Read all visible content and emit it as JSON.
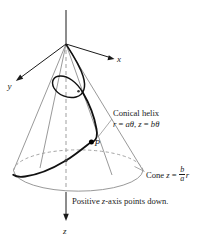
{
  "figure": {
    "background_color": "#ffffff",
    "ink_color": "#1a1a1a",
    "cone_color": "#8d8d8d",
    "curve_color": "#111111"
  },
  "axes": {
    "x_label": "x",
    "y_label": "y",
    "z_label": "z",
    "origin_note": "apex at top, z increases downward"
  },
  "points": {
    "p_label": "P"
  },
  "callouts": {
    "helix_title": "Conical helix",
    "helix_eq_r": "r",
    "helix_eq_eq1": " = ",
    "helix_eq_a": "a",
    "helix_eq_theta1": "θ",
    "helix_eq_sep": ", ",
    "helix_eq_z": "z",
    "helix_eq_eq2": " = ",
    "helix_eq_b": "b",
    "helix_eq_theta2": "θ",
    "cone_word": "Cone ",
    "cone_z": "z",
    "cone_eq": " = ",
    "cone_num": "b",
    "cone_den": "a",
    "cone_r": "r"
  },
  "caption": {
    "part1": "Positive ",
    "part2": "z",
    "part3": "-axis points down."
  }
}
